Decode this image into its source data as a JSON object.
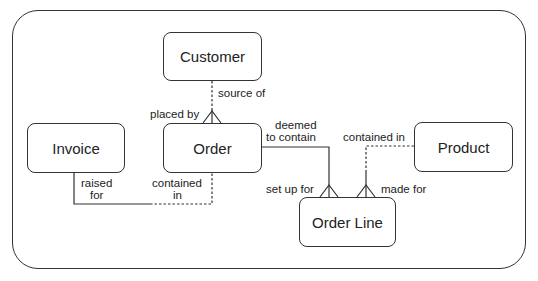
{
  "diagram": {
    "type": "entity-relationship",
    "entities": [
      {
        "id": "customer",
        "name": "Customer"
      },
      {
        "id": "order",
        "name": "Order"
      },
      {
        "id": "invoice",
        "name": "Invoice"
      },
      {
        "id": "product",
        "name": "Product"
      },
      {
        "id": "order_line",
        "name": "Order Line"
      }
    ],
    "relationships": [
      {
        "from": "customer",
        "to": "order",
        "from_label": "source of",
        "to_label": "placed by",
        "from_optional": true,
        "to_many": true
      },
      {
        "from": "invoice",
        "to": "order",
        "from_label": "raised for",
        "to_label": "contained in",
        "from_optional": false,
        "to_optional": true
      },
      {
        "from": "order",
        "to": "order_line",
        "from_label": "deemed to contain",
        "to_label": "set up for",
        "to_many": true
      },
      {
        "from": "product",
        "to": "order_line",
        "from_label": "contained in",
        "to_label": "made for",
        "from_optional": true,
        "to_many": true
      }
    ],
    "labels": {
      "source_of": "source of",
      "placed_by": "placed by",
      "raised": "raised",
      "for": "for",
      "contained": "contained",
      "in": "in",
      "deemed": "deemed",
      "to_contain": "to contain",
      "contained_in": "contained in",
      "set_up_for": "set up for",
      "made_for": "made for"
    }
  }
}
